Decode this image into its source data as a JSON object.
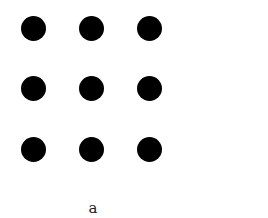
{
  "figure": {
    "caption": "a",
    "dot_color": "#000000",
    "grid": {
      "rows": 3,
      "cols": 3
    },
    "dots": [
      {
        "row": 0,
        "col": 0
      },
      {
        "row": 0,
        "col": 1
      },
      {
        "row": 0,
        "col": 2
      },
      {
        "row": 1,
        "col": 0
      },
      {
        "row": 1,
        "col": 1
      },
      {
        "row": 1,
        "col": 2
      },
      {
        "row": 2,
        "col": 0
      },
      {
        "row": 2,
        "col": 1
      },
      {
        "row": 2,
        "col": 2
      }
    ]
  }
}
